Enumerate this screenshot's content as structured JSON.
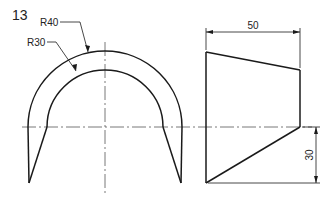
{
  "figure": {
    "number": "13",
    "colors": {
      "line": "#1a1a1a",
      "centerline": "#555555",
      "background": "#ffffff"
    }
  },
  "front_view": {
    "outer_radius_label": "R40",
    "inner_radius_label": "R30"
  },
  "side_view": {
    "width_dimension": "50",
    "height_dimension": "30"
  }
}
